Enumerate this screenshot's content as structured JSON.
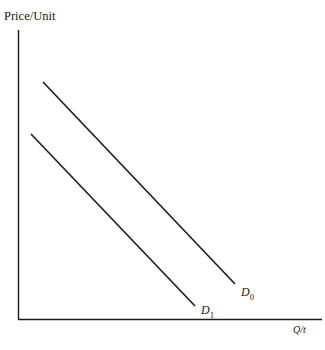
{
  "diagram": {
    "type": "economics-demand-shift",
    "y_axis_label": "Price/Unit",
    "x_axis_label": "Q/t",
    "curves": [
      {
        "name": "D",
        "subscript": "0",
        "start": [
          43,
          82
        ],
        "end": [
          235,
          284
        ]
      },
      {
        "name": "D",
        "subscript": "1",
        "start": [
          31,
          134
        ],
        "end": [
          195,
          306
        ]
      }
    ],
    "colors": {
      "line": "#1a1a1a",
      "background": "#ffffff"
    }
  }
}
